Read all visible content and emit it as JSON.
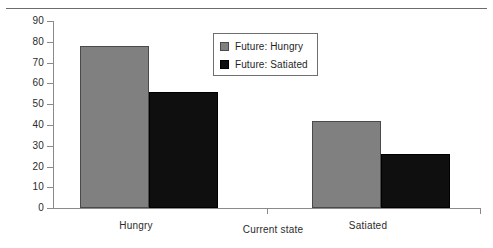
{
  "chart_data": {
    "type": "bar",
    "title": "",
    "subtitle": "",
    "xlabel": "Current state",
    "ylabel": "",
    "categories": [
      "Hungry",
      "Satiated"
    ],
    "series": [
      {
        "name": "Future: Hungry",
        "values": [
          78,
          42
        ],
        "color": "#808080"
      },
      {
        "name": "Future: Satiated",
        "values": [
          56,
          26
        ],
        "color": "#0f0f0f"
      }
    ],
    "ylim": [
      0,
      90
    ],
    "ytick_labels": [
      "0",
      "10",
      "20",
      "30",
      "40",
      "50",
      "60",
      "70",
      "80",
      "90"
    ],
    "ytick_values": [
      0,
      10,
      20,
      30,
      40,
      50,
      60,
      70,
      80,
      90
    ],
    "grid": false,
    "legend_position": "upper center",
    "grouped": true
  },
  "legend": {
    "entries": [
      {
        "label": "Future: Hungry",
        "swatch": "legend-swatch-gray"
      },
      {
        "label": "Future: Satiated",
        "swatch": "legend-swatch-black"
      }
    ]
  },
  "axes": {
    "x_title": "Current state",
    "x_categories": [
      "Hungry",
      "Satiated"
    ],
    "y_labels": [
      "90",
      "80",
      "70",
      "60",
      "50",
      "40",
      "30",
      "20",
      "10",
      "0"
    ]
  }
}
